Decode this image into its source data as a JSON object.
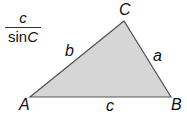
{
  "formula": {
    "numerator": "c",
    "denominator_func": "sin",
    "denominator_var": "C"
  },
  "triangle": {
    "fill": "#d6d6d6",
    "stroke": "#555555",
    "vertices": {
      "A": {
        "label": "A",
        "x": 30,
        "y": 97
      },
      "B": {
        "label": "B",
        "x": 171,
        "y": 97
      },
      "C": {
        "label": "C",
        "x": 124,
        "y": 21
      }
    },
    "sides": {
      "a": "a",
      "b": "b",
      "c": "c"
    }
  }
}
